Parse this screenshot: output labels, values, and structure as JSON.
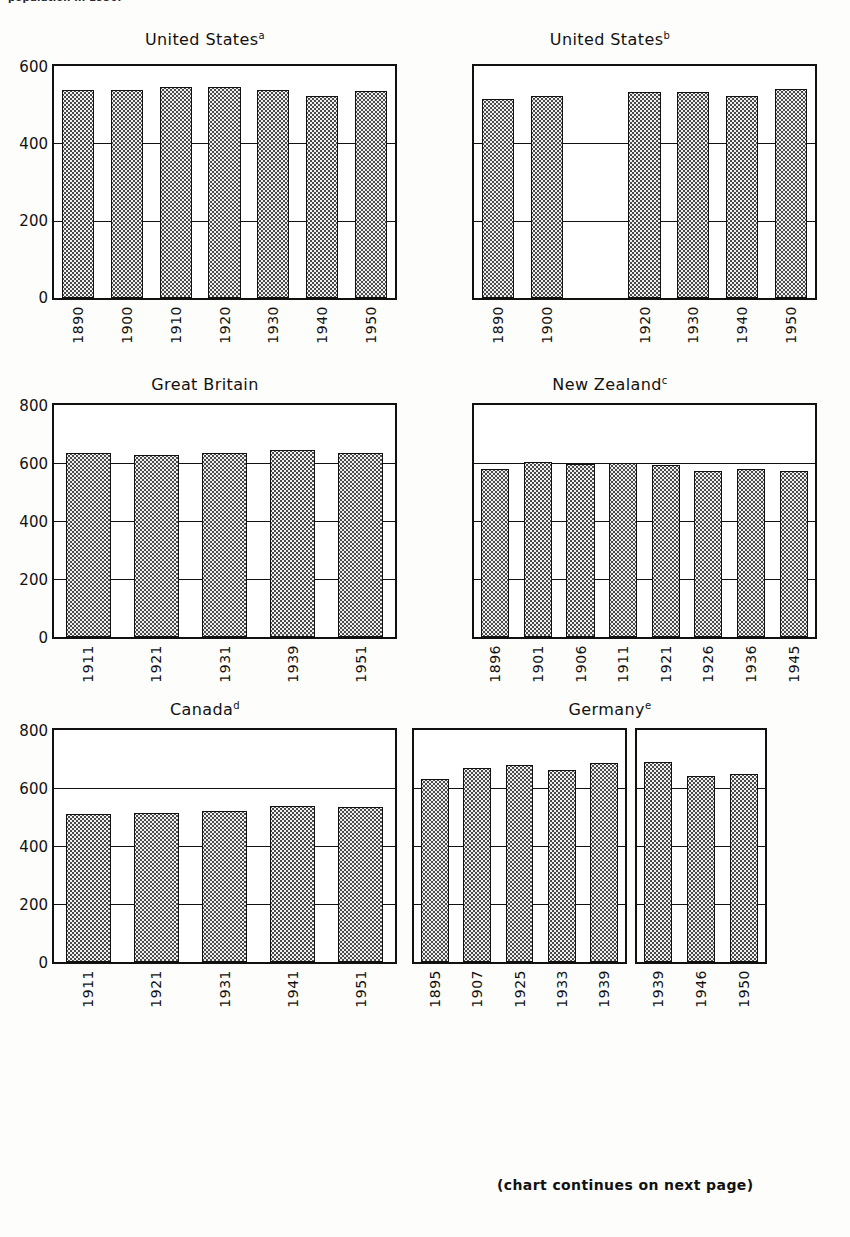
{
  "top_fragment": "population in 1950.",
  "footer": "(chart continues on next page)",
  "chart_data": [
    {
      "type": "bar",
      "title": "United States",
      "title_superscript": "a",
      "xlabel": "",
      "ylabel": "",
      "ylim": [
        0,
        600
      ],
      "yticks": [
        0,
        200,
        400,
        600
      ],
      "grid": true,
      "categories": [
        "1890",
        "1900",
        "1910",
        "1920",
        "1930",
        "1940",
        "1950"
      ],
      "values": [
        538,
        538,
        545,
        546,
        537,
        522,
        535
      ]
    },
    {
      "type": "bar",
      "title": "United States",
      "title_superscript": "b",
      "xlabel": "",
      "ylabel": "",
      "ylim": [
        0,
        600
      ],
      "yticks": [
        0,
        200,
        400,
        600
      ],
      "grid": true,
      "categories": [
        "1890",
        "1900",
        "1920",
        "1930",
        "1940",
        "1950"
      ],
      "values": [
        515,
        523,
        534,
        533,
        523,
        540
      ]
    },
    {
      "type": "bar",
      "title": "Great Britain",
      "title_superscript": "",
      "xlabel": "",
      "ylabel": "",
      "ylim": [
        0,
        800
      ],
      "yticks": [
        0,
        200,
        400,
        600,
        800
      ],
      "grid": true,
      "categories": [
        "1911",
        "1921",
        "1931",
        "1939",
        "1951"
      ],
      "values": [
        634,
        627,
        633,
        645,
        633
      ]
    },
    {
      "type": "bar",
      "title": "New Zealand",
      "title_superscript": "c",
      "xlabel": "",
      "ylabel": "",
      "ylim": [
        0,
        800
      ],
      "yticks": [
        0,
        200,
        400,
        600,
        800
      ],
      "grid": true,
      "categories": [
        "1896",
        "1901",
        "1906",
        "1911",
        "1921",
        "1926",
        "1936",
        "1945"
      ],
      "values": [
        581,
        602,
        595,
        601,
        594,
        572,
        581,
        573
      ]
    },
    {
      "type": "bar",
      "title": "Canada",
      "title_superscript": "d",
      "xlabel": "",
      "ylabel": "",
      "ylim": [
        0,
        800
      ],
      "yticks": [
        0,
        200,
        400,
        600,
        800
      ],
      "grid": true,
      "categories": [
        "1911",
        "1921",
        "1931",
        "1941",
        "1951"
      ],
      "values": [
        511,
        513,
        521,
        539,
        534
      ]
    },
    {
      "type": "bar",
      "title": "Germany",
      "title_superscript": "e",
      "xlabel": "",
      "ylabel": "",
      "ylim": [
        0,
        800
      ],
      "yticks": [
        0,
        200,
        400,
        600,
        800
      ],
      "grid": true,
      "split_panels": true,
      "panels": [
        {
          "categories": [
            "1895",
            "1907",
            "1925",
            "1933",
            "1939"
          ],
          "values": [
            630,
            668,
            681,
            661,
            686
          ]
        },
        {
          "categories": [
            "1939",
            "1946",
            "1950"
          ],
          "values": [
            690,
            643,
            647
          ]
        }
      ]
    }
  ]
}
